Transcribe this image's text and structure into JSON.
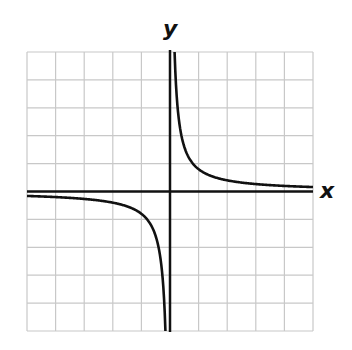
{
  "chart_data": {
    "type": "line",
    "title": "",
    "xlabel": "x",
    "ylabel": "y",
    "xlim": [
      -5,
      5
    ],
    "ylim": [
      -5,
      5
    ],
    "grid": true,
    "grid_cells": 10,
    "tick_labels": false,
    "legend": null,
    "series": [
      {
        "name": "y = k/x (hyperbola)",
        "k": 0.8,
        "branches": [
          {
            "x": [
              0.16,
              0.2,
              0.3,
              0.5,
              1,
              2,
              3,
              4,
              5
            ],
            "y": [
              5.0,
              4.0,
              2.67,
              1.6,
              0.8,
              0.4,
              0.27,
              0.2,
              0.16
            ]
          },
          {
            "x": [
              -5,
              -4,
              -3,
              -2,
              -1,
              -0.5,
              -0.3,
              -0.2,
              -0.16
            ],
            "y": [
              -0.16,
              -0.2,
              -0.27,
              -0.4,
              -0.8,
              -1.6,
              -2.67,
              -4.0,
              -5.0
            ]
          }
        ]
      }
    ],
    "asymptotes": {
      "vertical": 0,
      "horizontal": 0
    }
  },
  "labels": {
    "x_axis": "x",
    "y_axis": "y"
  },
  "colors": {
    "grid": "#c8c8c8",
    "axes": "#111111",
    "curve": "#111111",
    "background": "#ffffff"
  }
}
